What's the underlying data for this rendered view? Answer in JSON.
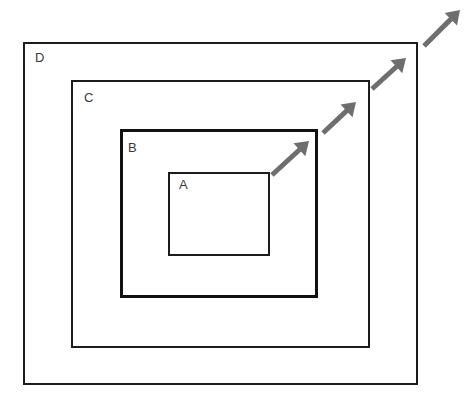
{
  "diagram": {
    "background_color": "#ffffff",
    "canvas": {
      "width": 466,
      "height": 402
    },
    "boxes": [
      {
        "id": "box-d",
        "label": "D",
        "x": 23,
        "y": 42,
        "width": 395,
        "height": 343,
        "stroke_color": "#1c1c1c",
        "stroke_width": 2,
        "fill": "none",
        "label_x": 35,
        "label_y": 51
      },
      {
        "id": "box-c",
        "label": "C",
        "x": 71,
        "y": 80,
        "width": 299,
        "height": 268,
        "stroke_color": "#1c1c1c",
        "stroke_width": 2,
        "fill": "none",
        "label_x": 84,
        "label_y": 91
      },
      {
        "id": "box-b",
        "label": "B",
        "x": 120,
        "y": 129,
        "width": 198,
        "height": 169,
        "stroke_color": "#111111",
        "stroke_width": 3,
        "fill": "none",
        "label_x": 128,
        "label_y": 141
      },
      {
        "id": "box-a",
        "label": "A",
        "x": 168,
        "y": 172,
        "width": 102,
        "height": 84,
        "stroke_color": "#1c1c1c",
        "stroke_width": 2,
        "fill": "none",
        "label_x": 179,
        "label_y": 178
      }
    ],
    "arrows": [
      {
        "id": "arrow-1",
        "x1": 272,
        "y1": 175,
        "x2": 309,
        "y2": 141,
        "color": "#6e6e6e",
        "width": 5
      },
      {
        "id": "arrow-2",
        "x1": 323,
        "y1": 133,
        "x2": 356,
        "y2": 102,
        "color": "#6e6e6e",
        "width": 5
      },
      {
        "id": "arrow-3",
        "x1": 372,
        "y1": 89,
        "x2": 406,
        "y2": 58,
        "color": "#6e6e6e",
        "width": 5
      },
      {
        "id": "arrow-4",
        "x1": 424,
        "y1": 46,
        "x2": 460,
        "y2": 10,
        "color": "#6e6e6e",
        "width": 5
      }
    ]
  }
}
